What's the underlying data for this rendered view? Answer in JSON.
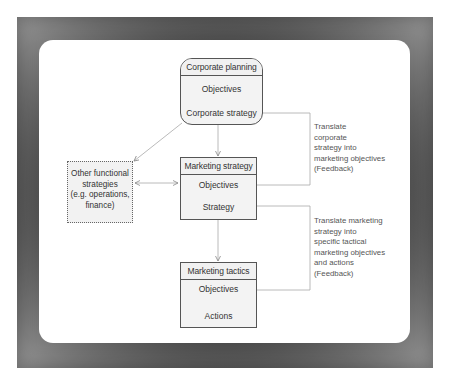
{
  "diagram": {
    "type": "flowchart",
    "boxes": {
      "corporate_planning": {
        "title": "Corporate planning",
        "items": [
          "Objectives",
          "Corporate strategy"
        ]
      },
      "marketing_strategy": {
        "title": "Marketing strategy",
        "items": [
          "Objectives",
          "Strategy"
        ]
      },
      "marketing_tactics": {
        "title": "Marketing tactics",
        "items": [
          "Objectives",
          "Actions"
        ]
      },
      "other_functional": {
        "lines": [
          "Other functional",
          "strategies",
          "(e.g. operations,",
          "finance)"
        ]
      }
    },
    "notes": {
      "feedback_1": "Translate\ncorporate\nstrategy into\nmarketing objectives\n(Feedback)",
      "feedback_2": "Translate marketing\nstrategy into\nspecific tactical\nmarketing objectives\nand actions\n(Feedback)"
    },
    "edges": [
      {
        "from": "Corporate planning",
        "to": "Marketing strategy",
        "style": "arrow"
      },
      {
        "from": "Corporate planning",
        "to": "Other functional strategies",
        "style": "arrow"
      },
      {
        "from": "Other functional strategies",
        "to": "Marketing strategy",
        "style": "double-arrow"
      },
      {
        "from": "Marketing strategy",
        "to": "Marketing tactics",
        "style": "arrow"
      },
      {
        "from": "Corporate strategy",
        "to": "Marketing strategy Objectives",
        "style": "feedback-loop"
      },
      {
        "from": "Marketing strategy Strategy",
        "to": "Marketing tactics Objectives",
        "style": "feedback-loop"
      }
    ],
    "colors": {
      "frame": "#4a4a4a",
      "panel": "#ffffff",
      "box_border": "#555555",
      "box_fill": "#f3f3f3",
      "connector": "#9a9a9a"
    }
  }
}
